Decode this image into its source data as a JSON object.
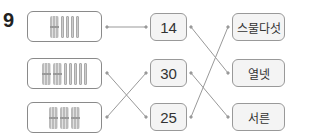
{
  "question": {
    "number": "9"
  },
  "left_items": [
    {
      "description": "1 bundle of ten + 4 single sticks",
      "bundles": 1,
      "sticks": 4
    },
    {
      "description": "2 bundles of ten + 5 single sticks",
      "bundles": 2,
      "sticks": 5
    },
    {
      "description": "3 bundles of ten",
      "bundles": 3,
      "sticks": 0
    }
  ],
  "numbers": [
    "14",
    "30",
    "25"
  ],
  "korean_words": [
    "스물다섯",
    "열넷",
    "서른"
  ],
  "connections": {
    "left_to_numbers": [
      [
        "row1",
        "14"
      ],
      [
        "row2",
        "25"
      ],
      [
        "row3",
        "30"
      ]
    ],
    "numbers_to_words": [
      [
        "14",
        "열넷"
      ],
      [
        "30",
        "서른"
      ],
      [
        "25",
        "스물다섯"
      ]
    ]
  },
  "colors": {
    "line": "#888888",
    "box_border": "#999999",
    "box_fill": "#f4f4f4"
  }
}
